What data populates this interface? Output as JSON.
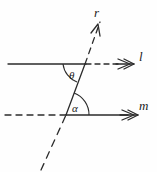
{
  "figure": {
    "stroke_color": "#2b2b2b",
    "background_color": "#ffffff",
    "labels": {
      "ray_r": "r",
      "line_l": "l",
      "line_m": "m",
      "angle_theta": "θ",
      "angle_alpha": "α"
    },
    "elements": [
      {
        "name": "line-l",
        "label": "l",
        "kind": "horizontal-line",
        "y": 64,
        "solid_from_x": 8,
        "solid_to_x": 85,
        "dashed_from_x": 85,
        "dashed_to_x": 118,
        "arrowheads": 2,
        "arrow_direction": "right"
      },
      {
        "name": "line-m",
        "label": "m",
        "kind": "horizontal-line",
        "y": 115,
        "dashed_from_x": 5,
        "dashed_to_x": 66,
        "solid_from_x": 66,
        "solid_to_x": 124,
        "arrowheads": 2,
        "arrow_direction": "right"
      },
      {
        "name": "ray-r",
        "label": "r",
        "kind": "transversal-ray",
        "from": [
          42,
          170
        ],
        "through": [
          [
            66,
            115
          ],
          [
            85,
            64
          ]
        ],
        "to": [
          99,
          24
        ],
        "solid_segment": [
          [
            66,
            115
          ],
          [
            85,
            64
          ]
        ],
        "dashed_segments": [
          [
            [
              42,
              170
            ],
            [
              66,
              115
            ]
          ],
          [
            [
              85,
              64
            ],
            [
              99,
              24
            ]
          ]
        ],
        "arrowheads": 1,
        "arrow_direction": "up-right"
      },
      {
        "name": "angle-theta",
        "label": "θ",
        "vertex": [
          85,
          64
        ],
        "position": "below-left of upper intersection",
        "arc_radius": 22
      },
      {
        "name": "angle-alpha",
        "label": "α",
        "vertex": [
          66,
          115
        ],
        "position": "above-right of lower intersection",
        "arc_radius": 23
      }
    ]
  }
}
